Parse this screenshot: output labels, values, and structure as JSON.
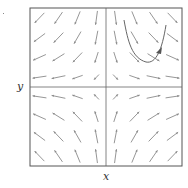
{
  "figure": {
    "type": "direction-field",
    "x_label": "x",
    "y_label": "y",
    "frame": {
      "left": 30,
      "top": 8,
      "right": 182,
      "bottom": 166
    },
    "origin_px": {
      "x": 106,
      "y": 87
    },
    "grid": {
      "cols": 8,
      "rows": 8
    },
    "field": "x' = x, y' = -y",
    "colors": {
      "frame": "#555555",
      "arrows": "#8a8a8a",
      "trajectory": "#666666"
    },
    "trajectory": {
      "quadrant": "upper-right",
      "path": "M124,20 C128,42 132,58 146,62 C156,64 162,50 166,25",
      "arrowhead_at": {
        "x": 159,
        "y": 52
      }
    }
  }
}
